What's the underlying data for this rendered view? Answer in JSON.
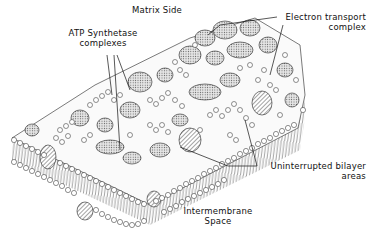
{
  "diagram": {
    "labels": {
      "matrix_side": "Matrix Side",
      "atp_synthetase_line1": "ATP  Synthetase",
      "atp_synthetase_line2": "complexes",
      "electron_transport_line1": "Electron  transport",
      "electron_transport_line2": "complex",
      "bilayer_line1": "Uninterrupted  bilayer",
      "bilayer_line2": "areas",
      "intermembrane_line1": "Intermembrane",
      "intermembrane_line2": "Space"
    },
    "colors": {
      "ink": "#111111",
      "background": "#ffffff",
      "protein_fill": "#d8d8d8"
    }
  }
}
